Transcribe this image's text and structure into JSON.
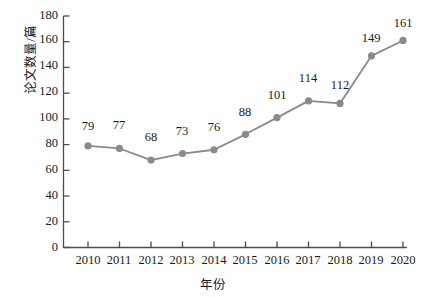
{
  "chart_data": {
    "type": "line",
    "title": "",
    "subtitle": "",
    "xlabel": "年份",
    "ylabel": "论文数量/篇",
    "categories": [
      "2010",
      "2011",
      "2012",
      "2013",
      "2014",
      "2015",
      "2016",
      "2017",
      "2018",
      "2019",
      "2020"
    ],
    "x": [
      2010,
      2011,
      2012,
      2013,
      2014,
      2015,
      2016,
      2017,
      2018,
      2019,
      2020
    ],
    "values": [
      79,
      77,
      68,
      73,
      76,
      88,
      101,
      114,
      112,
      149,
      161
    ],
    "point_labels": [
      "79",
      "77",
      "68",
      "73",
      "76",
      "88",
      "101",
      "114",
      "112",
      "149",
      "161"
    ],
    "series": [
      {
        "name": "论文数量",
        "values": [
          79,
          77,
          68,
          73,
          76,
          88,
          101,
          114,
          112,
          149,
          161
        ]
      }
    ],
    "ylim": [
      0,
      180
    ],
    "ytick_values": [
      0,
      20,
      40,
      60,
      80,
      100,
      120,
      140,
      160,
      180
    ],
    "ytick_labels": [
      "0",
      "20",
      "40",
      "60",
      "80",
      "100",
      "120",
      "140",
      "160",
      "180"
    ],
    "xlim": [
      2010,
      2020
    ],
    "grid": false,
    "legend": null,
    "legend_position": "none",
    "annotations": [],
    "colors": {
      "line": "#8a8a8a",
      "marker": "#8a8a8a",
      "axis": "#4d4d4d",
      "text": "#1a1a1a",
      "background": "#ffffff"
    },
    "marker": "circle",
    "show_data_labels": true
  }
}
